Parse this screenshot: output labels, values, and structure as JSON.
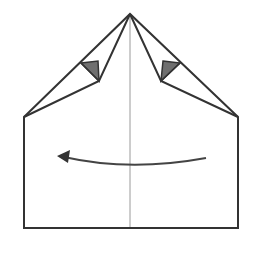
{
  "diagram": {
    "type": "origami-fold-step",
    "colors": {
      "background": "#ffffff",
      "outline": "#333333",
      "center_crease": "#999999",
      "flap_fill": "#6f6f6f",
      "arrow": "#444444"
    },
    "shapes": {
      "outline": "24,117 130,14 238,117 238,228 24,228",
      "left_fold_outer": "24,117 130,14",
      "left_fold_inner": "24,117 99,81 130,14",
      "right_fold_inner": "238,117 161,81 130,14",
      "left_flap": "81,63 98,61 99,81",
      "right_flap": "163,61 180,63 161,81",
      "center_crease": "130,14 130,228",
      "arrow_path": "M206,158 Q130,172 64,157",
      "arrow_head": "58,156 70,150 68,163"
    }
  }
}
